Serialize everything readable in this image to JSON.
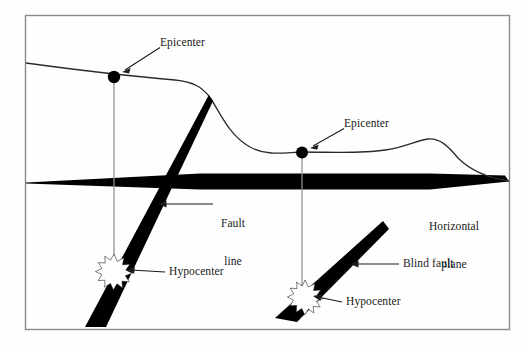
{
  "figure": {
    "type": "geology-cross-section",
    "background_color": "#fefefe",
    "frame_color": "#8a8a8a",
    "fill_color": "#000000",
    "curve_color": "#2b2b2b",
    "guide_line_color": "#8f8f8f"
  },
  "labels": {
    "epicenter_left": "Epicenter",
    "epicenter_right": "Epicenter",
    "fault_line_1": "Fault",
    "fault_line_2": "line",
    "hypocenter_left": "Hypocenter",
    "hypocenter_right": "Hypocenter",
    "blind_fault": "Blind fault",
    "horizontal_plane_1": "Horizontal",
    "horizontal_plane_2": "plane"
  },
  "markers": {
    "epicenter_left_dot": "epicenter-dot",
    "epicenter_right_dot": "epicenter-dot",
    "hypocenter_left_burst": "hypocenter-starburst",
    "hypocenter_right_burst": "hypocenter-starburst"
  }
}
